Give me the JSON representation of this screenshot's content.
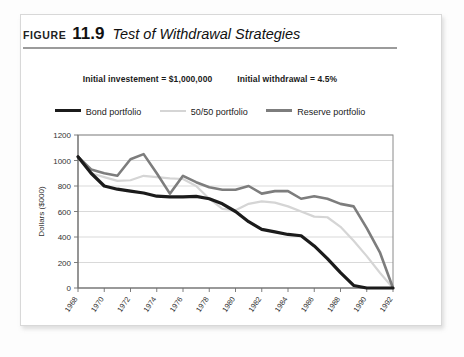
{
  "figure": {
    "label": "FIGURE",
    "number": "11.9",
    "title": "Test of Withdrawal Strategies"
  },
  "subtitle": {
    "investment": "Initial investement = $1,000,000",
    "withdrawal": "Initial withdrawal = 4.5%"
  },
  "legend": {
    "items": [
      {
        "label": "Bond portfolio",
        "color": "#1b1b1b"
      },
      {
        "label": "50/50 portfolio",
        "color": "#d5d5d5"
      },
      {
        "label": "Reserve portfolio",
        "color": "#7d7d7d"
      }
    ]
  },
  "colors": {
    "bond": "#1b1b1b",
    "fifty_fifty": "#d5d5d5",
    "reserve": "#7d7d7d",
    "grid": "#c9c9c9",
    "axis": "#6f6f6f",
    "frame": "#d8d8d8"
  },
  "chart_data": {
    "type": "line",
    "title": "Test of Withdrawal Strategies",
    "xlabel": "",
    "ylabel": "Dollars ($000)",
    "ylim": [
      0,
      1200
    ],
    "ytick_labels": [
      "0",
      "200",
      "400",
      "600",
      "800",
      "1000",
      "1200"
    ],
    "ytick_values": [
      0,
      200,
      400,
      600,
      800,
      1000,
      1200
    ],
    "grid": true,
    "legend_position": "top",
    "x": [
      1968,
      1969,
      1970,
      1971,
      1972,
      1973,
      1974,
      1975,
      1976,
      1977,
      1978,
      1979,
      1980,
      1981,
      1982,
      1983,
      1984,
      1985,
      1986,
      1987,
      1988,
      1989,
      1990,
      1991,
      1992
    ],
    "xtick_labels": [
      "1968",
      "1970",
      "1972",
      "1974",
      "1976",
      "1978",
      "1980",
      "1982",
      "1984",
      "1986",
      "1988",
      "1990",
      "1992"
    ],
    "xtick_values": [
      1968,
      1970,
      1972,
      1974,
      1976,
      1978,
      1980,
      1982,
      1984,
      1986,
      1988,
      1990,
      1992
    ],
    "series": [
      {
        "name": "Bond portfolio",
        "color": "#1b1b1b",
        "width": 3.2,
        "values": [
          1030,
          900,
          800,
          775,
          760,
          745,
          720,
          715,
          715,
          718,
          700,
          660,
          600,
          520,
          460,
          440,
          420,
          410,
          330,
          230,
          120,
          20,
          0,
          0,
          0
        ]
      },
      {
        "name": "50/50 portfolio",
        "color": "#d5d5d5",
        "width": 2.2,
        "values": [
          1030,
          900,
          870,
          840,
          845,
          880,
          870,
          860,
          855,
          800,
          700,
          620,
          610,
          660,
          680,
          670,
          640,
          600,
          560,
          555,
          480,
          370,
          250,
          120,
          0
        ]
      },
      {
        "name": "Reserve portfolio",
        "color": "#7d7d7d",
        "width": 2.6,
        "values": [
          1030,
          930,
          900,
          880,
          1010,
          1050,
          900,
          740,
          880,
          830,
          790,
          770,
          770,
          800,
          740,
          760,
          760,
          700,
          720,
          700,
          660,
          640,
          470,
          280,
          0
        ]
      }
    ]
  }
}
